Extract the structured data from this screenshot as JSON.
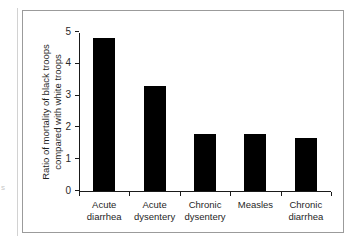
{
  "chart_data": {
    "type": "bar",
    "title": "",
    "subtitle": "",
    "xlabel": "",
    "ylabel": "Ratio of mortality of black troops compared with white troops",
    "categories": [
      "Acute diarrhea",
      "Acute dysentery",
      "Chronic dysentery",
      "Measles",
      "Chronic diarrhea"
    ],
    "category_lines": [
      [
        "Acute",
        "diarrhea"
      ],
      [
        "Acute",
        "dysentery"
      ],
      [
        "Chronic",
        "dysentery"
      ],
      [
        "Measles",
        ""
      ],
      [
        "Chronic",
        "diarrhea"
      ]
    ],
    "values": [
      4.82,
      3.3,
      1.8,
      1.8,
      1.68
    ],
    "ylim": [
      0,
      5
    ],
    "ytick_labels": [
      "0",
      "1",
      "2",
      "3",
      "4",
      "5"
    ],
    "ytick_values": [
      0,
      1,
      2,
      3,
      4,
      5
    ],
    "grid": false,
    "legend": false,
    "legend_position": "none",
    "bar_color": "#000000",
    "axis_color": "#1a1a1a",
    "text_color": "#1f1f1f",
    "background_color": "#ffffff",
    "frame_color": "#9b9b9b"
  },
  "figure": {
    "margin_artifact": "s"
  }
}
